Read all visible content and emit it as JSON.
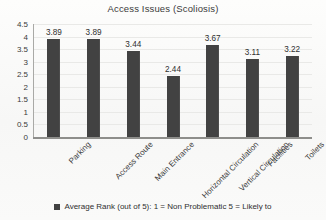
{
  "chart_data": {
    "type": "bar",
    "title": "Access Issues (Scoliosis)",
    "xlabel": "",
    "ylabel": "",
    "ylim": [
      0,
      4.5
    ],
    "ytick_step": 0.5,
    "yticks": [
      "4.5",
      "4",
      "3.5",
      "3",
      "2.5",
      "2",
      "1.5",
      "1",
      "0.5",
      "0"
    ],
    "grid": true,
    "legend_position": "bottom",
    "categories": [
      "Parking",
      "Access Route",
      "Main Entrance",
      "Horizontal Circulation",
      "Vertical Circulation",
      "Facilities",
      "Toilets"
    ],
    "values": [
      3.89,
      3.89,
      3.44,
      2.44,
      3.67,
      3.11,
      3.22
    ],
    "data_labels": [
      "3.89",
      "3.89",
      "3.44",
      "2.44",
      "3.67",
      "3.11",
      "3.22"
    ],
    "series": [
      {
        "name": "Average Rank (out of 5): 1 = Non Problematic 5 = Likely to",
        "values": [
          3.89,
          3.89,
          3.44,
          2.44,
          3.67,
          3.11,
          3.22
        ],
        "color": "#424242"
      }
    ],
    "legend": [
      {
        "label": "Average Rank (out of 5): 1 = Non Problematic 5 = Likely to",
        "color": "#424242"
      }
    ]
  },
  "colors": {
    "bar": "#424242",
    "axis": "#8e8e8b",
    "grid": "#e9e9e7",
    "background": "#fbfbfa",
    "text": "#2f2f2f"
  }
}
